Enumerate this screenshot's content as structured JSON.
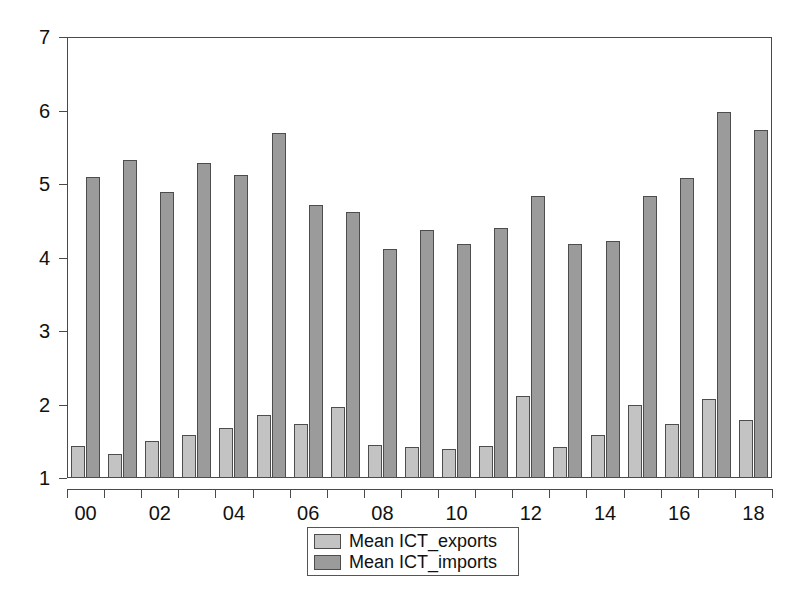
{
  "chart_data": {
    "type": "bar",
    "title": "",
    "subtitle": "",
    "xlabel": "",
    "ylabel": "",
    "categories": [
      "00",
      "01",
      "02",
      "03",
      "04",
      "05",
      "06",
      "07",
      "08",
      "09",
      "10",
      "11",
      "12",
      "13",
      "14",
      "15",
      "16",
      "17",
      "18"
    ],
    "tick_labels": [
      "00",
      "",
      "02",
      "",
      "04",
      "",
      "06",
      "",
      "08",
      "",
      "10",
      "",
      "12",
      "",
      "14",
      "",
      "16",
      "",
      "18"
    ],
    "series": [
      {
        "name": "Mean ICT_exports",
        "color": "#c3c3c3",
        "values": [
          1.43,
          1.33,
          1.5,
          1.58,
          1.68,
          1.86,
          1.74,
          1.96,
          1.45,
          1.42,
          1.4,
          1.44,
          2.12,
          1.42,
          1.59,
          1.99,
          1.74,
          2.08,
          1.79
        ]
      },
      {
        "name": "Mean ICT_imports",
        "color": "#9b9b9b",
        "values": [
          5.1,
          5.33,
          4.89,
          5.28,
          5.12,
          5.69,
          4.71,
          4.62,
          4.12,
          4.38,
          4.18,
          4.4,
          4.83,
          4.18,
          4.23,
          4.84,
          5.08,
          5.98,
          5.74
        ]
      }
    ],
    "ylim": [
      1,
      7
    ],
    "yticks": [
      1,
      2,
      3,
      4,
      5,
      6,
      7
    ],
    "ytick_labels": [
      "1",
      "2",
      "3",
      "4",
      "5",
      "6",
      "7"
    ],
    "grid": false,
    "legend_position": "bottom-center",
    "bar_baseline": 1
  },
  "legend": {
    "entries": [
      {
        "label": "Mean ICT_exports",
        "swatch": "exports"
      },
      {
        "label": "Mean ICT_imports",
        "swatch": "imports"
      }
    ]
  }
}
